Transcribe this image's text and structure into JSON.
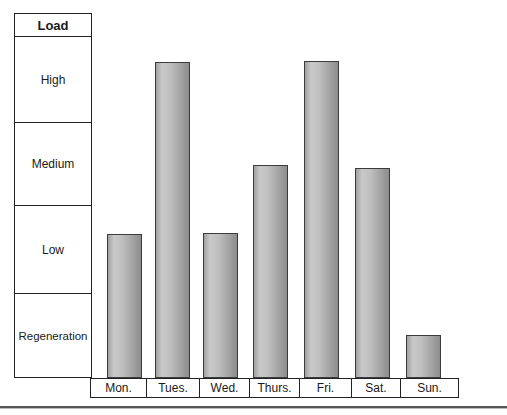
{
  "figure": {
    "legend_title": "Load",
    "load_levels": [
      "High",
      "Medium",
      "Low",
      "Regeneration"
    ]
  },
  "chart_data": {
    "type": "bar",
    "title": "Load",
    "categories": [
      "Mon.",
      "Tues.",
      "Wed.",
      "Thurs.",
      "Fri.",
      "Sat.",
      "Sun."
    ],
    "values": [
      1.67,
      3.66,
      1.68,
      2.47,
      3.68,
      2.43,
      0.5
    ],
    "levels_reached": [
      "Low",
      "High",
      "Low",
      "Medium",
      "High",
      "Medium",
      "Regeneration"
    ],
    "y_bands": [
      "Regeneration",
      "Low",
      "Medium",
      "High"
    ],
    "ylim": [
      0,
      4
    ],
    "xlabel": "",
    "ylabel": "Load",
    "grid": false,
    "legend_position": "left-table",
    "colors": {
      "bar_light": "#c9c9c9",
      "bar_dark": "#8d8d8d",
      "bar_border": "#3c3c3c",
      "line": "#222222",
      "background": "#ffffff",
      "bottom_rule": "#565656"
    }
  }
}
